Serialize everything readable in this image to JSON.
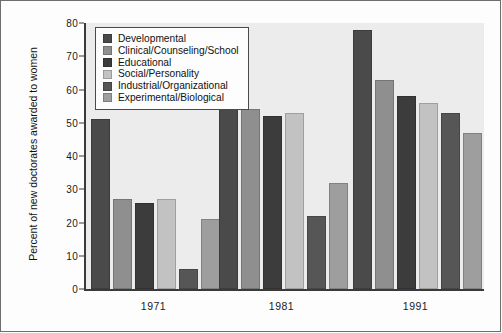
{
  "chart_data": {
    "type": "bar",
    "title": "",
    "xlabel": "",
    "ylabel": "Percent of new doctorates awarded to women",
    "ylim": [
      0,
      80
    ],
    "yticks": [
      0,
      10,
      20,
      30,
      40,
      50,
      60,
      70,
      80
    ],
    "ytick_labels": [
      "0",
      "10",
      "20",
      "30",
      "40",
      "50",
      "60",
      "70",
      "80"
    ],
    "grid": false,
    "legend_position": "upper-left-inside",
    "categories": [
      "1971",
      "1981",
      "1991"
    ],
    "series": [
      {
        "name": "Developmental",
        "color": "#4a4a4a",
        "values": [
          51,
          60,
          78
        ]
      },
      {
        "name": "Clinical/Counseling/School",
        "color": "#8f8f8f",
        "values": [
          27,
          54,
          63
        ]
      },
      {
        "name": "Educational",
        "color": "#3c3c3c",
        "values": [
          26,
          52,
          58
        ]
      },
      {
        "name": "Social/Personality",
        "color": "#c2c2c2",
        "values": [
          27,
          53,
          56
        ]
      },
      {
        "name": "Industrial/Organizational",
        "color": "#565656",
        "values": [
          6,
          22,
          53
        ]
      },
      {
        "name": "Experimental/Biological",
        "color": "#9e9e9e",
        "values": [
          21,
          32,
          47
        ]
      }
    ]
  },
  "colors": {
    "plot_background": "#ececec",
    "figure_background": "#fdfdfd",
    "axis": "#3a3a3a",
    "frame": "#6e6e6e",
    "text": "#111111"
  }
}
